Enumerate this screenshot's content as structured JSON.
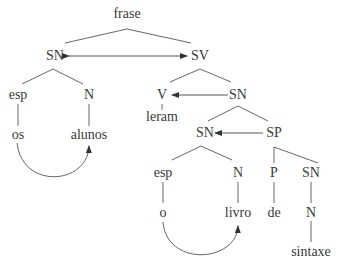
{
  "diagram": {
    "type": "syntax-tree",
    "nodes": {
      "frase": "frase",
      "sn_top": "SN",
      "sv": "SV",
      "esp_1": "esp",
      "n_1": "N",
      "os": "os",
      "alunos": "alunos",
      "v": "V",
      "leram": "leram",
      "sn_obj": "SN",
      "sn_inner": "SN",
      "sp": "SP",
      "esp_2": "esp",
      "n_2": "N",
      "o": "o",
      "livro": "livro",
      "p": "P",
      "de": "de",
      "sn_sp": "SN",
      "n_3": "N",
      "sintaxe": "sintaxe"
    },
    "relations": [
      {
        "from": "SN",
        "to": "SV",
        "type": "bidirectional-arrow"
      },
      {
        "from": "SN",
        "to": "V",
        "type": "arrow"
      },
      {
        "from": "SP",
        "to": "SN",
        "type": "arrow"
      },
      {
        "from": "os",
        "to": "alunos",
        "type": "curved-arrow"
      },
      {
        "from": "o",
        "to": "livro",
        "type": "curved-arrow"
      }
    ],
    "colors": {
      "text": "#3a3a3a",
      "lines": "#555555",
      "background": "#ffffff"
    }
  }
}
